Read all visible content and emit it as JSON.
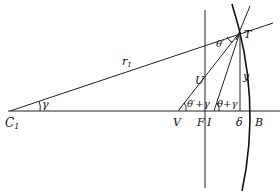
{
  "figure": {
    "type": "geometric-optics-diagram",
    "colors": {
      "line": "#222222",
      "background": "#ffffff"
    },
    "points": {
      "C1": {
        "label": "C",
        "sub": "1"
      },
      "V": {
        "label": "V"
      },
      "F": {
        "label": "F"
      },
      "I": {
        "label": "I"
      },
      "delta": {
        "label": "δ"
      },
      "B": {
        "label": "B"
      },
      "T": {
        "label": "T"
      },
      "U": {
        "label": "U"
      }
    },
    "segments": {
      "r1": {
        "label": "r",
        "sub": "1"
      },
      "y": {
        "label": "y"
      }
    },
    "angles": {
      "gamma": {
        "label": "γ"
      },
      "theta_prime": {
        "label": "θ′"
      },
      "theta_prime_plus_gamma": {
        "label": "θ′+γ"
      },
      "theta_plus_gamma": {
        "label": "θ+γ"
      }
    }
  }
}
